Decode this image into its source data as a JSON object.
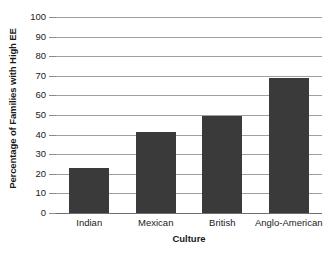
{
  "chart_data": {
    "type": "bar",
    "title": "",
    "subtitle": "",
    "xlabel": "Culture",
    "ylabel": "Percentage of Families with High EE",
    "categories": [
      "Indian",
      "Mexican",
      "British",
      "Anglo-American"
    ],
    "values": [
      23,
      41.5,
      49.5,
      69
    ],
    "series": [
      {
        "name": "Percentage of Families with High EE",
        "values": [
          23,
          41.5,
          49.5,
          69
        ]
      }
    ],
    "ylim": [
      0,
      100
    ],
    "ytick_labels": [
      "0",
      "10",
      "20",
      "30",
      "40",
      "50",
      "60",
      "70",
      "80",
      "90",
      "100"
    ],
    "ytick_values": [
      0,
      10,
      20,
      30,
      40,
      50,
      60,
      70,
      80,
      90,
      100
    ],
    "grid": true,
    "grid_axis": "y",
    "legend": false,
    "legend_position": "none",
    "bar_color": "#3a3a3a",
    "gridline_color": "#a0a0a0",
    "axis_color": "#6e6e6e",
    "background_color": "#ffffff",
    "text_color": "#1a1a1a"
  }
}
